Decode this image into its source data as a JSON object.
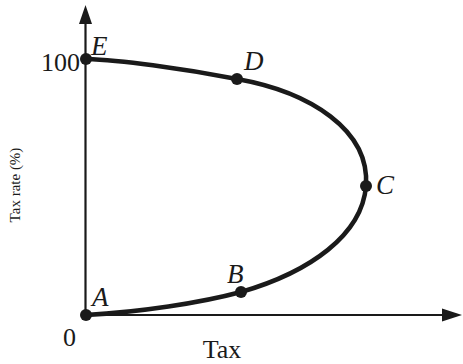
{
  "diagram": {
    "type": "laffer-curve",
    "axes": {
      "x_label": "Tax",
      "y_label": "Tax rate (%)",
      "origin_label": "0",
      "y_tick_label": "100"
    },
    "points": [
      {
        "id": "A",
        "label": "A",
        "description": "0% tax rate, zero tax revenue"
      },
      {
        "id": "B",
        "label": "B",
        "description": "low tax rate, moderate revenue"
      },
      {
        "id": "C",
        "label": "C",
        "description": "revenue-maximizing tax rate"
      },
      {
        "id": "D",
        "label": "D",
        "description": "high tax rate, moderate revenue"
      },
      {
        "id": "E",
        "label": "E",
        "description": "100% tax rate, zero tax revenue"
      }
    ],
    "colors": {
      "ink": "#1a1a1a",
      "background": "#ffffff"
    }
  }
}
